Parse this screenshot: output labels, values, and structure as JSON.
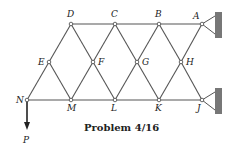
{
  "caption": "Problem 4/16",
  "load_label": "P",
  "nodes": {
    "A": {
      "x": 202,
      "y": 24,
      "label": "A"
    },
    "B": {
      "x": 159,
      "y": 24,
      "label": "B"
    },
    "C": {
      "x": 115,
      "y": 24,
      "label": "C"
    },
    "D": {
      "x": 71,
      "y": 24,
      "label": "D"
    },
    "E": {
      "x": 49,
      "y": 62,
      "label": "E"
    },
    "F": {
      "x": 93,
      "y": 62,
      "label": "F"
    },
    "G": {
      "x": 137,
      "y": 62,
      "label": "G"
    },
    "H": {
      "x": 181,
      "y": 62,
      "label": "H"
    },
    "N": {
      "x": 27,
      "y": 100,
      "label": "N"
    },
    "M": {
      "x": 71,
      "y": 100,
      "label": "M"
    },
    "L": {
      "x": 115,
      "y": 100,
      "label": "L"
    },
    "K": {
      "x": 159,
      "y": 100,
      "label": "K"
    },
    "J": {
      "x": 202,
      "y": 100,
      "label": "J"
    }
  },
  "members": [
    [
      "D",
      "C"
    ],
    [
      "C",
      "B"
    ],
    [
      "B",
      "A"
    ],
    [
      "N",
      "M"
    ],
    [
      "M",
      "L"
    ],
    [
      "L",
      "K"
    ],
    [
      "K",
      "J"
    ],
    [
      "N",
      "E"
    ],
    [
      "E",
      "D"
    ],
    [
      "D",
      "F"
    ],
    [
      "F",
      "L"
    ],
    [
      "E",
      "M"
    ],
    [
      "M",
      "F"
    ],
    [
      "F",
      "C"
    ],
    [
      "C",
      "G"
    ],
    [
      "G",
      "K"
    ],
    [
      "L",
      "G"
    ],
    [
      "G",
      "B"
    ],
    [
      "B",
      "H"
    ],
    [
      "H",
      "J"
    ],
    [
      "K",
      "H"
    ],
    [
      "H",
      "A"
    ]
  ],
  "supports": [
    {
      "node": "A",
      "type": "pin-wall"
    },
    {
      "node": "J",
      "type": "pin-wall"
    }
  ],
  "colors": {
    "line": "#555555",
    "wall": "#777777",
    "text": "#222222"
  }
}
